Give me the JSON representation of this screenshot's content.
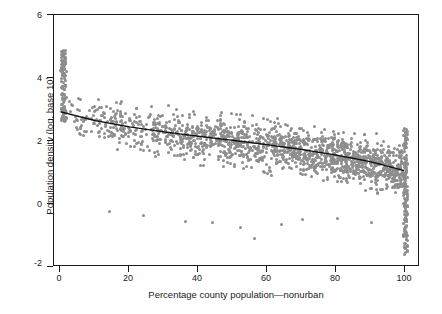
{
  "chart_data": {
    "type": "scatter",
    "title": "",
    "xlabel": "Percentage county population—nonurban",
    "ylabel": "Population density (log, base 10)",
    "xlim": [
      -2,
      104
    ],
    "ylim": [
      -2,
      6
    ],
    "xticks": [
      0,
      20,
      40,
      60,
      80,
      100
    ],
    "yticks": [
      -2,
      0,
      2,
      4,
      6
    ],
    "grid": false,
    "legend": null,
    "point_color": "#8d8d8d",
    "fit_color": "#111111",
    "series": [
      {
        "name": "counties",
        "marker": "circle",
        "n_points": 1600,
        "x": [
          0,
          100
        ],
        "description": "Dense gray scatter of US counties; density falls as nonurban percentage rises; heavy vertical pile-ups at x=0 (values ~2 to 5) and x=100 (values ~-1.5 to 2.5)."
      },
      {
        "name": "fitted curve",
        "marker": "line",
        "x": [
          0,
          10,
          20,
          30,
          40,
          50,
          60,
          70,
          80,
          90,
          100
        ],
        "y": [
          2.9,
          2.62,
          2.42,
          2.26,
          2.12,
          1.99,
          1.85,
          1.7,
          1.52,
          1.31,
          1.02
        ]
      }
    ]
  },
  "axes": {
    "y_tick_labels": [
      "6",
      "4",
      "2",
      "0",
      "-2"
    ],
    "x_tick_labels": [
      "0",
      "20",
      "40",
      "60",
      "80",
      "100"
    ]
  }
}
